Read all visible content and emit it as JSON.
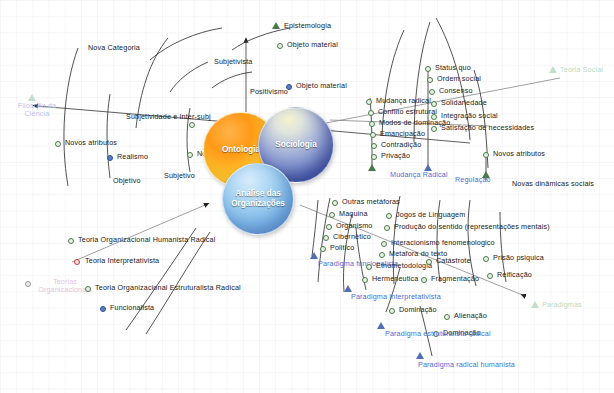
{
  "diagram": {
    "colors": {
      "node_green_border": "#4a7a4a",
      "node_blue": "#5b7fc4",
      "node_red_border": "#c23b3b",
      "paradigm_label_blue": "#4a6fd4",
      "faded_blue": "#b9c4e8",
      "faded_green": "#b9dcc0",
      "faded_purple": "#e2c4dd",
      "sphere_ontologia": "#ff9a18",
      "sphere_sociologia": "#5e72bb",
      "sphere_analise": "#7fb9e8"
    }
  },
  "spheres": {
    "ontologia": "Ontologia",
    "sociologia": "Sociologia",
    "analise": "Análise das Organizações"
  },
  "axis_labels": {
    "filosofia_da_ciencia_line1": "Filosofia da",
    "filosofia_da_ciencia_line2": "Ciência",
    "teorias_organizacionais_line1": "Teorias",
    "teorias_organizacionais_line2": "Organizacionais",
    "teoria_social": "Teoria Social",
    "paradigmas": "Paradigmas",
    "epistemologia": "Epistemologia"
  },
  "nodes": {
    "nova_categoria": "Nova Categoria",
    "subjetivista": "Subjetivista",
    "positivismo": "Positivismo",
    "objeto_material_green": "Objeto material",
    "objeto_material_blue": "Objeto material",
    "subjetividade_intersubj": "Subjetividade e Inter-subj",
    "novos_atributos_left": "Novos atributos",
    "realismo": "Realismo",
    "nominalismo": "Nominalismo",
    "objetivo": "Objetivo",
    "subjetivo": "Subjetivo",
    "status_quo": "Status quo",
    "ordem_social": "Ordem social",
    "consenso": "Consenso",
    "solidariedade": "Solidariedade",
    "integracao_social": "Integração social",
    "satisfacao_necessidades": "Satisfação de necessidades",
    "mudanca_radical_node": "Mudança radical",
    "conflito_estrutural": "Conflito estrutural",
    "modos_de_dominacao": "Modos de dominação",
    "emancipacao": "Emancipação",
    "contradicao": "Contradição",
    "privacao": "Privação",
    "mudanca_radical_axis": "Mudança Radical",
    "regulacao_axis": "Regulação",
    "novos_atributos_right": "Novos atributos",
    "novas_dinamicas_sociais": "Novas dinâmicas sociais",
    "outras_metaforas": "Outras metáforas",
    "maquina": "Maquina",
    "organismo": "Organismo",
    "cibernetico": "Cibernético",
    "politico": "Politico",
    "jogos_de_linguagem": "Jogos de Linguagem",
    "producao_do_sentido": "Produção do sentido (representações mentais)",
    "interacionismo_fenomenologico": "Interacionismo fenomenologico",
    "metafora_do_texto": "Metafora do texto",
    "etnometodologia": "Etnometodologia",
    "hermeneutica": "Hermeneutica",
    "catastrote": "Catástrote",
    "fragmentacao": "Fragmentação",
    "prisao_psiquica": "Prisão psiquica",
    "reificacao": "Reificação",
    "dominacao_1": "Dominação",
    "alienacao": "Alienação",
    "dominacao_2": "Dominação",
    "teoria_org_humanista_radical": "Teoria Organizacional Humanista Radical",
    "teoria_interpretativista": "Teoria Interpretativista",
    "teoria_org_estruturalista_radical": "Teoria Organizacional  Estruturalista Radical",
    "funcionalista": "Funcionalista",
    "paradigma_funcionalista": "Paradigma funcionalista",
    "paradigma_interpretativista": "Paradigma Interpretativista",
    "paradigma_estruturalista_radical": "Paradigma estruturalista radical",
    "paradigma_radical_humanista": "Paradigma radical humanista"
  }
}
